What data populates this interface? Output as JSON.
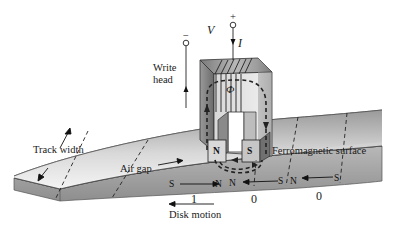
{
  "diagram": {
    "labels": {
      "voltage": "V",
      "current": "I",
      "plus_terminal": "+",
      "minus_terminal": "−",
      "write_head_line1": "Write",
      "write_head_line2": "head",
      "flux": "Φ",
      "track_width": "Track width",
      "air_gap": "Air gap",
      "ferromagnetic_surface": "Ferromagnetic surface",
      "disk_motion": "Disk motion"
    },
    "head_poles": [
      "N",
      "S"
    ],
    "surface_poles": [
      "S",
      "N",
      "N",
      "S",
      "N",
      "S"
    ],
    "bits": [
      "1",
      "0",
      "0"
    ],
    "colors": {
      "surface_light": "#f2f2f2",
      "surface_dark": "#8a8a8a",
      "head_light": "#e6e6e6",
      "head_dark": "#6e6e6e",
      "line": "#1a1a1a"
    }
  }
}
